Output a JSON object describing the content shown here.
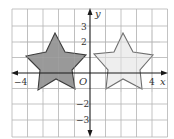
{
  "figure": {
    "type": "coordinate-plane",
    "grid": {
      "x_min": -5,
      "x_max": 5,
      "y_min": -4,
      "y_max": 4,
      "step": 1
    },
    "axes": {
      "x_label": "x",
      "y_label": "y",
      "origin_label": "O",
      "x_ticks": [
        {
          "value": -4,
          "label": "−4"
        },
        {
          "value": 4,
          "label": "4"
        }
      ],
      "y_ticks": [
        {
          "value": 3,
          "label": "3"
        },
        {
          "value": 2,
          "label": "2"
        },
        {
          "value": -2,
          "label": "−2"
        },
        {
          "value": -3,
          "label": "−3"
        }
      ]
    },
    "shapes": [
      {
        "name": "dark-star",
        "kind": "five-point-star",
        "fill": "#909090",
        "stroke": "#3c3c3c",
        "center": [
          -2,
          0.8
        ],
        "vertices": [
          [
            -2.25,
            2.6
          ],
          [
            -3.4,
            1.1
          ],
          [
            -3.35,
            -1.1
          ],
          [
            -2.2,
            -0.4
          ],
          [
            -1.0,
            -1.05
          ],
          [
            -0.25,
            1.15
          ]
        ]
      },
      {
        "name": "light-star",
        "kind": "five-point-star",
        "fill": "#ececec",
        "stroke": "#6e6e6e",
        "center": [
          2.2,
          0.8
        ],
        "vertices": [
          [
            2.15,
            2.6
          ],
          [
            0.25,
            1.2
          ],
          [
            1.05,
            -1.05
          ],
          [
            2.15,
            -0.4
          ],
          [
            3.35,
            -1.05
          ],
          [
            4.05,
            1.15
          ]
        ]
      }
    ],
    "colors": {
      "grid": "#b4b4b4",
      "axis": "#1a1a1a",
      "background": "#ffffff"
    }
  }
}
